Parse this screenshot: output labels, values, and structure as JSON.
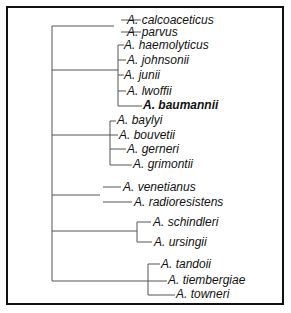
{
  "tree": {
    "line_color": "#555555",
    "highlight": "A. baumannii",
    "clades": [
      {
        "id": "calcoaceticus-parvus",
        "leaves": [
          {
            "label": "A. calcoaceticus",
            "x": 127,
            "y": 20
          },
          {
            "label": "A. parvus",
            "x": 127,
            "y": 33
          }
        ]
      },
      {
        "id": "haemolyticus-group",
        "leaves": [
          {
            "label": "A. haemolyticus",
            "x": 124,
            "y": 45
          },
          {
            "label": "A. johnsonii",
            "x": 127,
            "y": 60
          },
          {
            "label": "A. junii",
            "x": 124,
            "y": 75
          },
          {
            "label": "A. lwoffii",
            "x": 127,
            "y": 91
          },
          {
            "label": "A. baumannii",
            "x": 142,
            "y": 105,
            "bold": true
          }
        ]
      },
      {
        "id": "baylyi-group",
        "leaves": [
          {
            "label": "A. baylyi",
            "x": 117,
            "y": 119
          },
          {
            "label": "A. bouvetii",
            "x": 119,
            "y": 134
          },
          {
            "label": "A. gerneri",
            "x": 127,
            "y": 149
          },
          {
            "label": "A. grimontii",
            "x": 132,
            "y": 163
          }
        ]
      },
      {
        "id": "venetianus-group",
        "leaves": [
          {
            "label": "A. venetianus",
            "x": 122,
            "y": 185
          },
          {
            "label": "A. radioresistens",
            "x": 134,
            "y": 199
          }
        ]
      },
      {
        "id": "schindleri-group",
        "leaves": [
          {
            "label": "A. schindleri",
            "x": 152,
            "y": 220
          },
          {
            "label": "A. ursingii",
            "x": 153,
            "y": 240
          }
        ]
      },
      {
        "id": "tandoii-group",
        "leaves": [
          {
            "label": "A. tandoii",
            "x": 160,
            "y": 262
          },
          {
            "label": "A. tiembergiae",
            "x": 167,
            "y": 278
          },
          {
            "label": "A. towneri",
            "x": 175,
            "y": 292
          }
        ]
      }
    ]
  }
}
